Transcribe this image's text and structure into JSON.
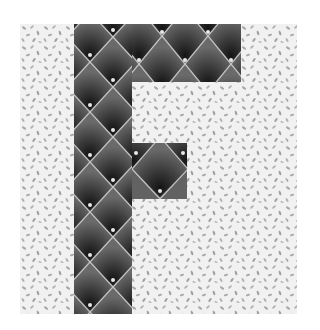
{
  "image": {
    "subject": "Quilt block of the letter F",
    "letter": "F",
    "colors": {
      "page_background": "#ffffff",
      "block_background": "#f1f1f1",
      "background_print": "#a8a8a8",
      "letter_fabric_base": "#5b5b5b",
      "letter_fabric_shadow": "#1e1e1e",
      "quilting_line": "#c4c4c4",
      "button_dot": "#e8e8e8"
    },
    "layout": {
      "block": {
        "x": 20,
        "y": 24,
        "w": 277,
        "h": 290
      },
      "stem": {
        "x": 74,
        "y": 24,
        "w": 58,
        "h": 290
      },
      "top_bar": {
        "x": 132,
        "y": 24,
        "w": 109,
        "h": 58
      },
      "middle_bar": {
        "x": 132,
        "y": 143,
        "w": 55,
        "h": 56
      },
      "diamond": {
        "w": 46,
        "h": 50
      }
    }
  }
}
